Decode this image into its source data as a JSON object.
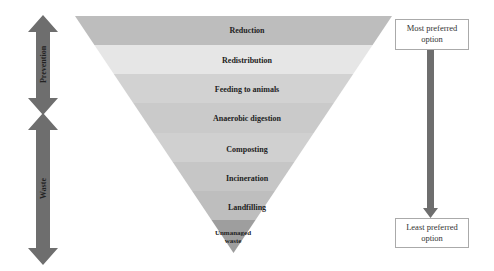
{
  "diagram": {
    "hierarchy_levels": [
      {
        "label": "Reduction",
        "color": "#bdbdbd"
      },
      {
        "label": "Redistribution",
        "color": "#e6e6e6"
      },
      {
        "label": "Feeding to animals",
        "color": "#d2d2d2"
      },
      {
        "label": "Anaerobic digestion",
        "color": "#cacaca"
      },
      {
        "label": "Composting",
        "color": "#d0d0d0"
      },
      {
        "label": "Incineration",
        "color": "#c6c6c6"
      },
      {
        "label": "Landfilling",
        "color": "#bebebe"
      },
      {
        "label": "Unmanaged waste",
        "color": "#9e9e9e"
      }
    ],
    "left_arrows": [
      {
        "label": "Prevention",
        "color": "#6e6e6e"
      },
      {
        "label": "Waste",
        "color": "#6e6e6e"
      }
    ],
    "right_scale": {
      "top_label": "Most preferred option",
      "bottom_label": "Least preferred option",
      "arrow_color": "#6e6e6e"
    }
  }
}
